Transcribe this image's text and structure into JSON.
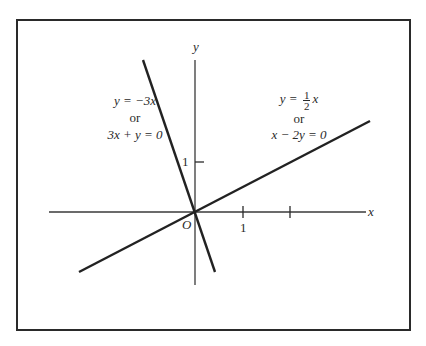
{
  "diagram": {
    "axes": {
      "x_label": "x",
      "y_label": "y",
      "origin_label": "O",
      "x_tick_label": "1",
      "y_tick_label": "1"
    },
    "line_steep": {
      "equation": "y = −3x",
      "connector": "or",
      "alt_equation": "3x + y = 0"
    },
    "line_shallow": {
      "eq_prefix": "y = ",
      "frac_num": "1",
      "frac_den": "2",
      "eq_suffix": "x",
      "connector": "or",
      "alt_equation": "x − 2y = 0"
    },
    "colors": {
      "ink": "#2a2a2a",
      "background": "#ffffff"
    }
  }
}
